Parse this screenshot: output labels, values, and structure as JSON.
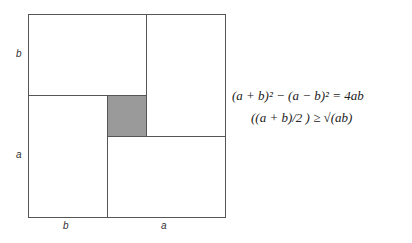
{
  "diagram": {
    "labels": {
      "left_top": "b",
      "left_bottom": "a",
      "bottom_left": "b",
      "bottom_right": "a"
    },
    "equations": [
      "(a + b)² − (a − b)²  =  4ab",
      "((a + b)/2 ) ≥ √(ab)"
    ],
    "colors": {
      "stroke": "#555555",
      "shade": "#9a9a9a"
    }
  }
}
